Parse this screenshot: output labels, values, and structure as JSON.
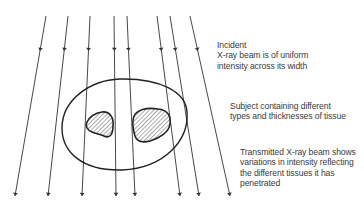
{
  "diagram": {
    "colors": {
      "line": "#333333",
      "outline": "#222222",
      "text": "#3a3a3a",
      "hatch": "#555555"
    },
    "labels": {
      "incident": {
        "lines": [
          "Incident",
          "X-ray beam is of uniform",
          "intensity across its width"
        ]
      },
      "subject": {
        "lines": [
          "Subject containing different",
          "types and thicknesses of tissue"
        ]
      },
      "transmitted": {
        "lines": [
          "Transmitted X-ray beam shows",
          "variations in intensity reflecting",
          "the different tissues it has",
          "penetrated"
        ]
      }
    },
    "rays": [
      {
        "x1": 46,
        "y1": 16,
        "x2": 15,
        "y2": 196
      },
      {
        "x1": 68,
        "y1": 16,
        "x2": 48,
        "y2": 196
      },
      {
        "x1": 90,
        "y1": 16,
        "x2": 82,
        "y2": 196
      },
      {
        "x1": 114,
        "y1": 16,
        "x2": 116,
        "y2": 196
      },
      {
        "x1": 127,
        "y1": 16,
        "x2": 135,
        "y2": 196
      },
      {
        "x1": 157,
        "y1": 16,
        "x2": 180,
        "y2": 196
      },
      {
        "x1": 170,
        "y1": 16,
        "x2": 199,
        "y2": 196
      },
      {
        "x1": 190,
        "y1": 16,
        "x2": 230,
        "y2": 196
      }
    ],
    "elements": [
      "incident-x-ray-beam",
      "subject-body-outline",
      "tissue-region-small",
      "tissue-region-large",
      "transmitted-x-ray-beam"
    ]
  }
}
